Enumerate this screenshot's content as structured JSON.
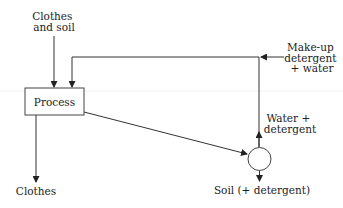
{
  "diagram": {
    "type": "process-flow",
    "inputs": {
      "clothes_and_soil": [
        "Clothes",
        "and soil"
      ],
      "makeup": [
        "Make-up",
        "detergent",
        "+ water"
      ]
    },
    "process": {
      "label": "Process"
    },
    "outputs": {
      "clothes": "Clothes",
      "soil": "Soil (+ detergent)"
    },
    "recycle": {
      "label": [
        "Water +",
        "detergent"
      ]
    },
    "separator": {
      "shape": "circle"
    },
    "colors": {
      "line": "#333333",
      "text": "#222222",
      "background": "#ffffff"
    }
  }
}
